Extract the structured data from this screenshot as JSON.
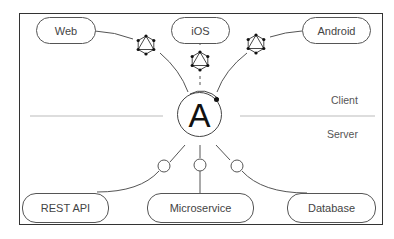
{
  "diagram": {
    "title": "",
    "hub": {
      "label": "A",
      "icon": "apollo-logo-icon"
    },
    "zones": {
      "client_label": "Client",
      "server_label": "Server"
    },
    "clients": [
      {
        "label": "Web",
        "connector": "graphql-icon"
      },
      {
        "label": "iOS",
        "connector": "graphql-icon"
      },
      {
        "label": "Android",
        "connector": "graphql-icon"
      }
    ],
    "servers": [
      {
        "label": "REST API",
        "connector": "circle-node"
      },
      {
        "label": "Microservice",
        "connector": "circle-node"
      },
      {
        "label": "Database",
        "connector": "circle-node"
      }
    ],
    "colors": {
      "line": "#555555",
      "frame": "#333333",
      "divider": "#bbbbbb",
      "text": "#444444"
    }
  }
}
